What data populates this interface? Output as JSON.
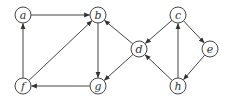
{
  "diagram": {
    "type": "directed-graph",
    "nodes": [
      {
        "id": "a",
        "label": "a",
        "x": 23,
        "y": 15
      },
      {
        "id": "b",
        "label": "b",
        "x": 98,
        "y": 15
      },
      {
        "id": "c",
        "label": "c",
        "x": 178,
        "y": 15
      },
      {
        "id": "d",
        "label": "d",
        "x": 139,
        "y": 49
      },
      {
        "id": "e",
        "label": "e",
        "x": 210,
        "y": 49
      },
      {
        "id": "f",
        "label": "f",
        "x": 23,
        "y": 86
      },
      {
        "id": "g",
        "label": "g",
        "x": 98,
        "y": 86
      },
      {
        "id": "h",
        "label": "h",
        "x": 178,
        "y": 86
      }
    ],
    "edges": [
      {
        "from": "a",
        "to": "b"
      },
      {
        "from": "f",
        "to": "a"
      },
      {
        "from": "f",
        "to": "b"
      },
      {
        "from": "b",
        "to": "g"
      },
      {
        "from": "g",
        "to": "f"
      },
      {
        "from": "d",
        "to": "b"
      },
      {
        "from": "d",
        "to": "g"
      },
      {
        "from": "c",
        "to": "d"
      },
      {
        "from": "c",
        "to": "e"
      },
      {
        "from": "e",
        "to": "h"
      },
      {
        "from": "h",
        "to": "c"
      },
      {
        "from": "h",
        "to": "d"
      }
    ],
    "colors": {
      "stroke": "#444444",
      "fill": "#ffffff",
      "text": "#333333"
    }
  }
}
